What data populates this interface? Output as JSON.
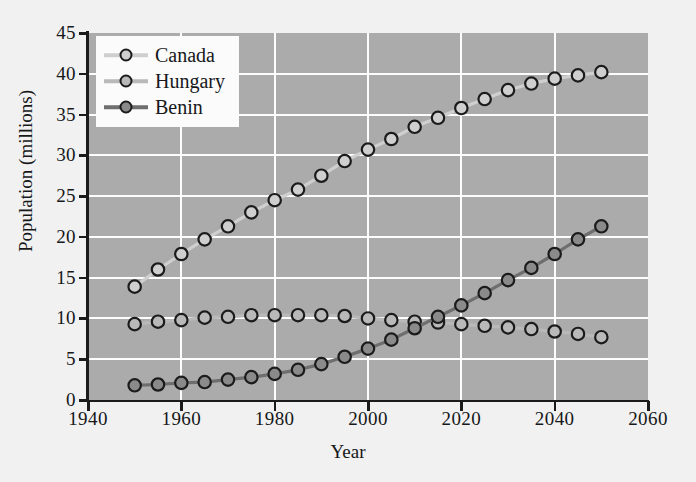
{
  "chart_data": {
    "type": "line",
    "title": "",
    "xlabel": "Year",
    "ylabel": "Population (millions)",
    "xlim": [
      1940,
      2060
    ],
    "ylim": [
      0,
      45
    ],
    "xticks": [
      1940,
      1960,
      1980,
      2000,
      2020,
      2040,
      2060
    ],
    "yticks": [
      0,
      5,
      10,
      15,
      20,
      25,
      30,
      35,
      40,
      45
    ],
    "grid": true,
    "legend_position": "top-left",
    "x": [
      1950,
      1955,
      1960,
      1965,
      1970,
      1975,
      1980,
      1985,
      1990,
      1995,
      2000,
      2005,
      2010,
      2015,
      2020,
      2025,
      2030,
      2035,
      2040,
      2045,
      2050
    ],
    "series": [
      {
        "name": "Canada",
        "color": "#cfcfcf",
        "marker_fill": "#cfcfcf",
        "values": [
          13.9,
          16.0,
          17.9,
          19.7,
          21.3,
          23.0,
          24.5,
          25.8,
          27.5,
          29.3,
          30.7,
          32.0,
          33.5,
          34.6,
          35.8,
          36.9,
          38.0,
          38.8,
          39.4,
          39.8,
          40.2
        ]
      },
      {
        "name": "Hungary",
        "color": "#b9b9b9",
        "marker_fill": "#b9b9b9",
        "values": [
          9.3,
          9.6,
          9.8,
          10.1,
          10.2,
          10.4,
          10.4,
          10.4,
          10.4,
          10.3,
          10.0,
          9.8,
          9.6,
          9.5,
          9.3,
          9.1,
          8.9,
          8.7,
          8.4,
          8.1,
          7.7
        ]
      },
      {
        "name": "Benin",
        "color": "#6e6e6e",
        "marker_fill": "#8a8a8a",
        "values": [
          1.8,
          1.9,
          2.1,
          2.2,
          2.5,
          2.8,
          3.2,
          3.7,
          4.4,
          5.3,
          6.3,
          7.4,
          8.8,
          10.2,
          11.6,
          13.1,
          14.7,
          16.2,
          17.9,
          19.7,
          21.3
        ]
      }
    ]
  },
  "legend": {
    "items": [
      {
        "label": "Canada"
      },
      {
        "label": "Hungary"
      },
      {
        "label": "Benin"
      }
    ]
  },
  "axes": {
    "x_title": "Year",
    "y_title": "Population (millions)"
  },
  "colors": {
    "plot_background": "#ababab",
    "page_background": "#f1f1f1",
    "gridline": "#fdfdfd",
    "axis": "#1b1b1b",
    "marker_edge": "#1b1b1b"
  }
}
